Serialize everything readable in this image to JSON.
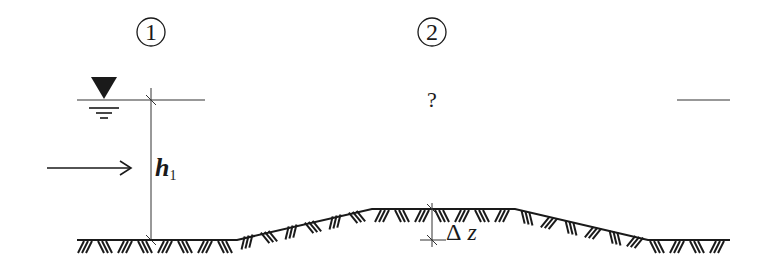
{
  "diagram": {
    "type": "open-channel flow over a hump (bed step)",
    "sections": [
      {
        "id": "section-1",
        "label": "1",
        "symbol": "①"
      },
      {
        "id": "section-2",
        "label": "2",
        "symbol": "②"
      }
    ],
    "labels": {
      "section1": "1",
      "section2": "2",
      "unknown_depth": "?",
      "depth_symbol": "h",
      "depth_subscript": "1",
      "step_delta": "Δ",
      "step_var": "z"
    },
    "symbols": {
      "water_surface": "inverted-triangle-free-surface-icon",
      "flow_direction": "right-arrow-icon",
      "ground": "ground-hatching"
    },
    "colors": {
      "ink": "#1a1a1a",
      "thin_line": "#333333",
      "background": "#ffffff"
    }
  }
}
